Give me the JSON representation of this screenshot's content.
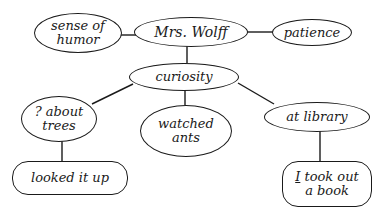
{
  "diagram": {
    "type": "concept-map",
    "nodes": {
      "center": {
        "label": "Mrs. Wolff"
      },
      "sense_of_humor": {
        "line1": "sense of",
        "line2": "humor"
      },
      "patience": {
        "label": "patience"
      },
      "curiosity": {
        "label": "curiosity"
      },
      "about_trees": {
        "line1": "? about",
        "line2": "trees"
      },
      "watched_ants": {
        "line1": "watched",
        "line2": "ants"
      },
      "at_library": {
        "label": "at library"
      },
      "looked_it_up": {
        "label": "looked it up"
      },
      "took_book": {
        "underlined": "I",
        "line1_rest": " took out",
        "line2": "a book"
      }
    },
    "edges": [
      [
        "sense_of_humor",
        "center"
      ],
      [
        "center",
        "patience"
      ],
      [
        "center",
        "curiosity"
      ],
      [
        "curiosity",
        "about_trees"
      ],
      [
        "curiosity",
        "watched_ants"
      ],
      [
        "curiosity",
        "at_library"
      ],
      [
        "about_trees",
        "looked_it_up"
      ],
      [
        "at_library",
        "took_book"
      ]
    ],
    "colors": {
      "ink": "#1a1a1a",
      "paper": "#ffffff"
    }
  }
}
